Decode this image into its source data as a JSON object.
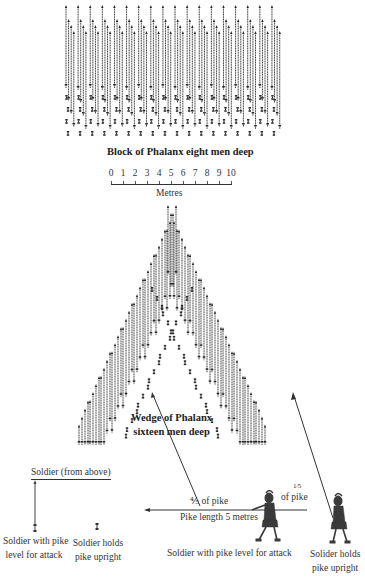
{
  "block_formation": {
    "caption": "Block of Phalanx eight men deep",
    "files": 18,
    "ranks": 8,
    "lowered_pike_ranks": 4,
    "upright_ranks": 4,
    "region": {
      "x": 66,
      "y": 5,
      "width": 212,
      "height": 135
    }
  },
  "scale_bar": {
    "ticks": [
      "0",
      "1",
      "2",
      "3",
      "4",
      "5",
      "6",
      "7",
      "8",
      "9",
      "10"
    ],
    "unit_label": "Metres",
    "x_start": 111,
    "x_end": 231,
    "y": 184
  },
  "wedge_formation": {
    "caption_line1": "Wedge of Phalanx",
    "caption_line2": "sixteen men deep",
    "ranks": 16,
    "apex": {
      "x": 172,
      "y": 205
    },
    "base_left_x": 72,
    "base_right_x": 270,
    "base_y": 445
  },
  "legend": {
    "title": "Soldier (from above)",
    "pike_level_label_line1": "Soldier with pike",
    "pike_level_label_line2": "level for attack",
    "pike_upright_label_line1": "Soldier holds",
    "pike_upright_label_line2": "pike upright"
  },
  "side_view": {
    "front_fraction_label": "⅘ of pike",
    "rear_fraction_numerator": "1⁄5",
    "rear_fraction_label": "of pike",
    "pike_length_label": "Pike length 5 metres",
    "level_soldier_caption": "Soldier with pike level for attack",
    "upright_soldier_caption_line1": "Solider holds",
    "upright_soldier_caption_line2": "pike upright"
  },
  "colors": {
    "ink": "#2a2a2a",
    "background": "#ffffff"
  }
}
